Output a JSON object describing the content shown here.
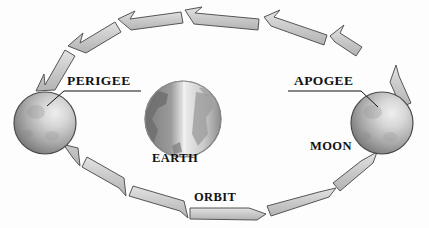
{
  "diagram": {
    "background_color": "#fdfdfd",
    "labels": {
      "perigee": "PERIGEE",
      "apogee": "APOGEE",
      "moon": "MOON",
      "earth": "EARTH",
      "orbit": "ORBIT"
    },
    "bodies": [
      {
        "name": "moon-perigee",
        "label": "PERIGEE",
        "cx": 45,
        "cy": 123,
        "r": 31,
        "dark_color": "#7a7a7a",
        "light_color": "#d8d8d8",
        "outline_color": "#4a4a4a"
      },
      {
        "name": "earth",
        "label": "EARTH",
        "cx": 183,
        "cy": 119,
        "r": 38,
        "dark_color": "#8a8a8a",
        "light_color": "#e2e2e2",
        "outline_color": "#5a5a5a"
      },
      {
        "name": "moon-apogee",
        "label": "APOGEE",
        "cx": 382,
        "cy": 123,
        "r": 31,
        "dark_color": "#7a7a7a",
        "light_color": "#d8d8d8",
        "outline_color": "#4a4a4a"
      }
    ],
    "orbit": {
      "label": "ORBIT",
      "shape": "ellipse",
      "cx": 214,
      "cy": 114,
      "rx": 175,
      "ry": 100,
      "direction": "counterclockwise",
      "band_color": "#c6c6c6",
      "band_highlight": "#e0e0e0",
      "band_outline": "#5c5c5c",
      "arrow_segments": 16
    },
    "leaders": [
      {
        "name": "perigee-leader",
        "underline": {
          "x1": 64,
          "y1": 91,
          "x2": 141,
          "y2": 91
        },
        "pointer": {
          "x1": 64,
          "y1": 91,
          "x2": 48,
          "y2": 105
        }
      },
      {
        "name": "apogee-leader",
        "underline": {
          "x1": 288,
          "y1": 91,
          "x2": 361,
          "y2": 91
        },
        "pointer": {
          "x1": 361,
          "y1": 91,
          "x2": 378,
          "y2": 106
        }
      }
    ]
  }
}
